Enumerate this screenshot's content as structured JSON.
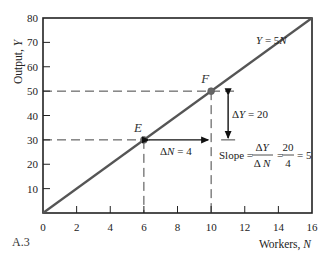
{
  "figure_label": "A.3",
  "colors": {
    "line": "#555555",
    "axis": "#222222",
    "point": "#666666",
    "dash": "#444444",
    "text": "#222222"
  },
  "chart_data": {
    "type": "line",
    "title": "",
    "xlabel": "Workers, N",
    "ylabel": "Output, Y",
    "xlim": [
      0,
      16
    ],
    "ylim": [
      0,
      80
    ],
    "x_ticks": [
      0,
      2,
      4,
      6,
      8,
      10,
      12,
      14,
      16
    ],
    "y_ticks": [
      10,
      20,
      30,
      40,
      50,
      60,
      70,
      80
    ],
    "grid": false,
    "series": [
      {
        "name": "Y = 5N",
        "x": [
          0,
          16
        ],
        "y": [
          0,
          80
        ]
      }
    ],
    "points": [
      {
        "label": "E",
        "x": 6,
        "y": 30
      },
      {
        "label": "F",
        "x": 10,
        "y": 50
      }
    ],
    "annotations": [
      {
        "text": "Y = 5N",
        "type": "line-label"
      },
      {
        "text": "ΔN = 4",
        "type": "horizontal-arrow",
        "from": [
          6,
          30
        ],
        "to": [
          10,
          30
        ]
      },
      {
        "text": "ΔY = 20",
        "type": "vertical-arrow",
        "from": [
          11,
          30
        ],
        "to": [
          11,
          50
        ]
      },
      {
        "text": "Slope = ΔY/ΔN = 20/4 = 5",
        "type": "formula"
      }
    ]
  },
  "labels": {
    "line_label": "Y = 5N",
    "ylabel_text": "Output, ",
    "ylabel_var": "Y",
    "xlabel_text": "Workers, ",
    "xlabel_var": "N",
    "delta_n": "ΔN = 4",
    "delta_y": "ΔY = 20",
    "slope_word": "Slope =",
    "slope_num": "ΔY",
    "slope_den": "Δ N",
    "slope_eq1": "=",
    "frac_num": "20",
    "frac_den": "4",
    "slope_result": "= 5"
  }
}
